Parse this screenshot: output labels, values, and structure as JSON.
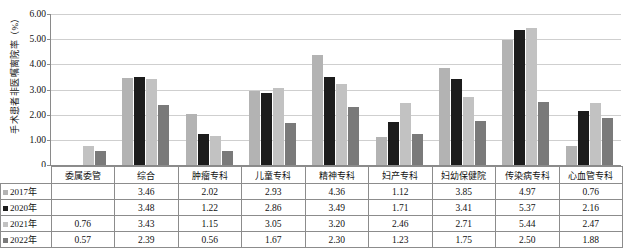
{
  "chart_data": {
    "type": "bar",
    "title": "",
    "xlabel": "",
    "ylabel": "手术患者非医嘱离院率（%）",
    "ylim": [
      0,
      6
    ],
    "grid": true,
    "legend_position": "table-row-labels",
    "ytick_labels": [
      "6.00",
      "5.00",
      "4.00",
      "3.00",
      "2.00",
      "1.00",
      "0"
    ],
    "ytick_values": [
      6,
      5,
      4,
      3,
      2,
      1,
      0
    ],
    "categories": [
      "委属委管",
      "综合",
      "肿瘤专科",
      "儿童专科",
      "精神专科",
      "妇产专科",
      "妇幼保健院",
      "传染病专科",
      "心血管专科"
    ],
    "series": [
      {
        "name": "2017年",
        "color": "#b3b3b3",
        "values": [
          null,
          3.46,
          2.02,
          2.93,
          4.36,
          1.12,
          3.85,
          4.97,
          0.76
        ],
        "labels": [
          "",
          "3.46",
          "2.02",
          "2.93",
          "4.36",
          "1.12",
          "3.85",
          "4.97",
          "0.76"
        ]
      },
      {
        "name": "2020年",
        "color": "#1c1c1c",
        "values": [
          null,
          3.48,
          1.22,
          2.86,
          3.49,
          1.71,
          3.41,
          5.37,
          2.16
        ],
        "labels": [
          "",
          "3.48",
          "1.22",
          "2.86",
          "3.49",
          "1.71",
          "3.41",
          "5.37",
          "2.16"
        ]
      },
      {
        "name": "2021年",
        "color": "#c2c2c2",
        "values": [
          0.76,
          3.43,
          1.15,
          3.05,
          3.2,
          2.46,
          2.71,
          5.44,
          2.47
        ],
        "labels": [
          "0.76",
          "3.43",
          "1.15",
          "3.05",
          "3.20",
          "2.46",
          "2.71",
          "5.44",
          "2.47"
        ]
      },
      {
        "name": "2022年",
        "color": "#7a7a7a",
        "values": [
          0.57,
          2.39,
          0.56,
          1.67,
          2.3,
          1.23,
          1.75,
          2.5,
          1.88
        ],
        "labels": [
          "0.57",
          "2.39",
          "0.56",
          "1.67",
          "2.30",
          "1.23",
          "1.75",
          "2.50",
          "1.88"
        ]
      }
    ]
  }
}
